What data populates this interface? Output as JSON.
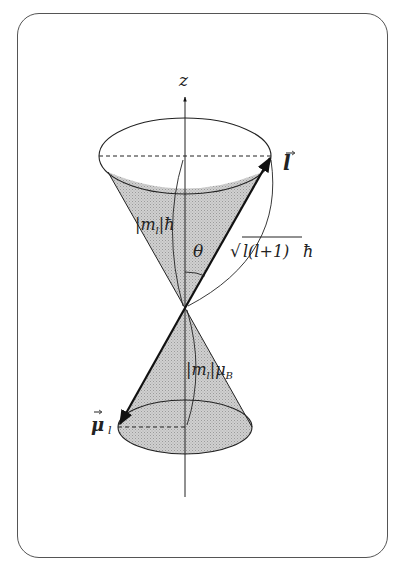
{
  "diagram": {
    "type": "vector-model-cone",
    "axis_label": "z",
    "labels": {
      "angular_momentum_vector": "l",
      "magnetic_moment_vector": "μ",
      "magnetic_moment_subscript": "l",
      "z_projection_L": "|m",
      "z_projection_L_sub": "l",
      "z_projection_L_tail": "|ħ",
      "magnitude_L_sqrt": "√",
      "magnitude_L_inner": "l(l+1)",
      "magnitude_L_tail": "ħ",
      "angle": "θ",
      "z_projection_mu": "|m",
      "z_projection_mu_sub": "l",
      "z_projection_mu_mid": "|μ",
      "z_projection_mu_sub2": "B"
    },
    "colors": {
      "cone_fill": "#c8c8c8",
      "stroke": "#222222",
      "frame": "#555555"
    }
  }
}
